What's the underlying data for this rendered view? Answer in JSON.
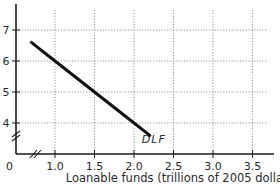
{
  "chart_data": {
    "type": "line",
    "title": "",
    "xlabel": "Loanable funds (trillions of 2005 dollars)",
    "ylabel": "",
    "origin_label": "0",
    "xlim": [
      0.7,
      3.75
    ],
    "ylim": [
      3.2,
      7.5
    ],
    "x_ticks": [
      1.0,
      1.5,
      2.0,
      2.5,
      3.0,
      3.5
    ],
    "x_tick_labels": [
      "1.0",
      "1.5",
      "2.0",
      "2.5",
      "3.0",
      "3.5"
    ],
    "y_ticks": [
      4,
      5,
      6,
      7
    ],
    "y_tick_labels": [
      "4",
      "5",
      "6",
      "7"
    ],
    "grid": true,
    "grid_style": "dotted",
    "axis_breaks": [
      "x",
      "y"
    ],
    "series": [
      {
        "name": "DLF",
        "color": "#111111",
        "x": [
          0.7,
          1.0,
          1.5,
          2.0,
          2.2
        ],
        "y": [
          6.6,
          6.0,
          5.0,
          4.0,
          3.6
        ]
      }
    ],
    "annotations": [
      {
        "text": "DLF",
        "x": 2.2,
        "y": 3.4,
        "style": "italic"
      }
    ],
    "legend": null
  }
}
